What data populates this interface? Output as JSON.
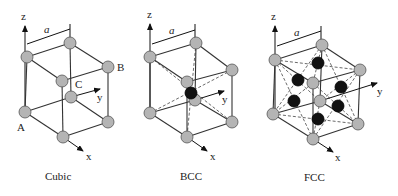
{
  "figures": [
    {
      "id": "cubic",
      "caption": "Cubic",
      "axis_labels": {
        "z": "z",
        "y": "y",
        "x": "x"
      },
      "lattice_param": "a",
      "point_labels": {
        "A": "A",
        "B": "B",
        "C": "C"
      }
    },
    {
      "id": "bcc",
      "caption": "BCC",
      "axis_labels": {
        "z": "z",
        "y": "y",
        "x": "x"
      },
      "lattice_param": "a"
    },
    {
      "id": "fcc",
      "caption": "FCC",
      "axis_labels": {
        "z": "z",
        "y": "y",
        "x": "x"
      },
      "lattice_param": "a"
    }
  ],
  "colors": {
    "corner_atom": "#b4b4b4",
    "center_atom": "#111111",
    "edge": "#333333"
  }
}
